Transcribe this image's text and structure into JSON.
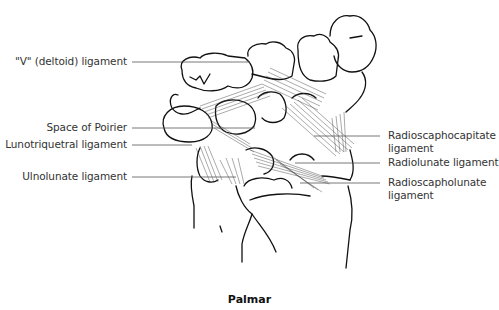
{
  "figure": {
    "caption": "Palmar",
    "labels_left": [
      {
        "id": "v-deltoid",
        "text": "\"V\" (deltoid) ligament"
      },
      {
        "id": "space-poirier",
        "text": "Space of Poirier"
      },
      {
        "id": "lunotriquetral",
        "text": "Lunotriquetral ligament"
      },
      {
        "id": "ulnolunate",
        "text": "Ulnolunate ligament"
      }
    ],
    "labels_right": [
      {
        "id": "radioscaphocapitate",
        "line1": "Radioscaphocapitate",
        "line2": "ligament"
      },
      {
        "id": "radiolunate",
        "line1": "Radiolunate ligament"
      },
      {
        "id": "radioscapholunate",
        "line1": "Radioscapholunate",
        "line2": "ligament"
      }
    ]
  }
}
